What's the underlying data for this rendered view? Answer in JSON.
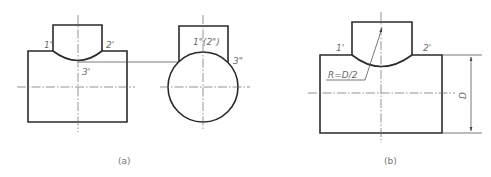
{
  "figure_a": {
    "caption": "(a)",
    "front_view": {
      "labels": {
        "p1": "1'",
        "p2": "2'",
        "p3": "3'"
      }
    },
    "side_view": {
      "labels": {
        "p12": "1\"(2\")",
        "p3": "3\""
      }
    }
  },
  "figure_b": {
    "caption": "(b)",
    "labels": {
      "p1": "1'",
      "p2": "2'"
    },
    "radius_annotation": "R=D/2",
    "dimension_label": "D"
  },
  "colors": {
    "outline": "#2a2a2a",
    "thin_line": "#555555",
    "text": "#6a6a6a",
    "background": "#ffffff"
  }
}
